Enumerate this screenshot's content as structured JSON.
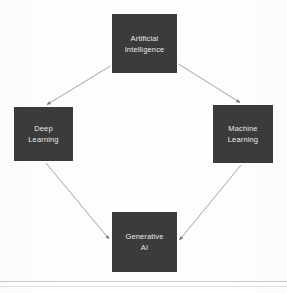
{
  "diagram": {
    "background_color": "#ffffff",
    "node_fill_color": "#3b3b3b",
    "node_text_color": "#f2f2f2",
    "connector_color": "#9a9a9a",
    "nodes": [
      {
        "id": "ai",
        "label": "Artificial\nIntelligence",
        "position": "top"
      },
      {
        "id": "dl",
        "label": "Deep\nLearning",
        "position": "left"
      },
      {
        "id": "ml",
        "label": "Machine\nLearning",
        "position": "right"
      },
      {
        "id": "genai",
        "label": "Generative\nAI",
        "position": "bottom"
      }
    ],
    "edges": [
      {
        "id": "ai-to-dl",
        "from": "Artificial Intelligence",
        "to": "Deep Learning",
        "arrow": "end"
      },
      {
        "id": "ai-to-ml",
        "from": "Artificial Intelligence",
        "to": "Machine Learning",
        "arrow": "end"
      },
      {
        "id": "dl-to-genai",
        "from": "Deep Learning",
        "to": "Generative AI",
        "arrow": "end"
      },
      {
        "id": "ml-to-genai",
        "from": "Machine Learning",
        "to": "Generative AI",
        "arrow": "end"
      }
    ]
  }
}
